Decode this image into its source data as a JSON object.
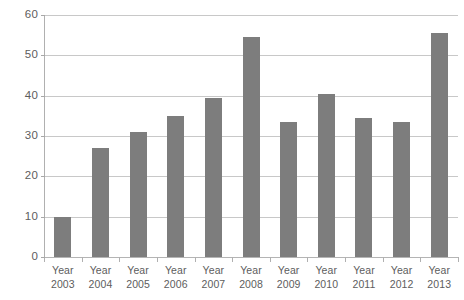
{
  "chart_data": {
    "type": "bar",
    "title": "",
    "subtitle": "",
    "xlabel": "",
    "ylabel": "",
    "categories": [
      "Year 2003",
      "Year 2004",
      "Year 2005",
      "Year 2006",
      "Year 2007",
      "Year 2008",
      "Year 2009",
      "Year 2010",
      "Year 2011",
      "Year 2012",
      "Year 2013"
    ],
    "category_lines": [
      {
        "line1": "Year",
        "line2": "2003"
      },
      {
        "line1": "Year",
        "line2": "2004"
      },
      {
        "line1": "Year",
        "line2": "2005"
      },
      {
        "line1": "Year",
        "line2": "2006"
      },
      {
        "line1": "Year",
        "line2": "2007"
      },
      {
        "line1": "Year",
        "line2": "2008"
      },
      {
        "line1": "Year",
        "line2": "2009"
      },
      {
        "line1": "Year",
        "line2": "2010"
      },
      {
        "line1": "Year",
        "line2": "2011"
      },
      {
        "line1": "Year",
        "line2": "2012"
      },
      {
        "line1": "Year",
        "line2": "2013"
      }
    ],
    "values": [
      10,
      27,
      31,
      35,
      39.5,
      54.5,
      33.5,
      40.5,
      34.5,
      33.5,
      55.5
    ],
    "ylim": [
      0,
      60
    ],
    "ytick_values": [
      0,
      10,
      20,
      30,
      40,
      50,
      60
    ],
    "ytick_labels": [
      "0",
      "10",
      "20",
      "30",
      "40",
      "50",
      "60"
    ],
    "grid": true,
    "grid_axis": "y",
    "legend": false,
    "legend_position": "none",
    "bar_color": "#7d7d7d",
    "gridline_color": "#c8c8c8",
    "axis_color": "#b4b4b4",
    "text_color": "#5d5d5d",
    "background_color": "#ffffff"
  }
}
